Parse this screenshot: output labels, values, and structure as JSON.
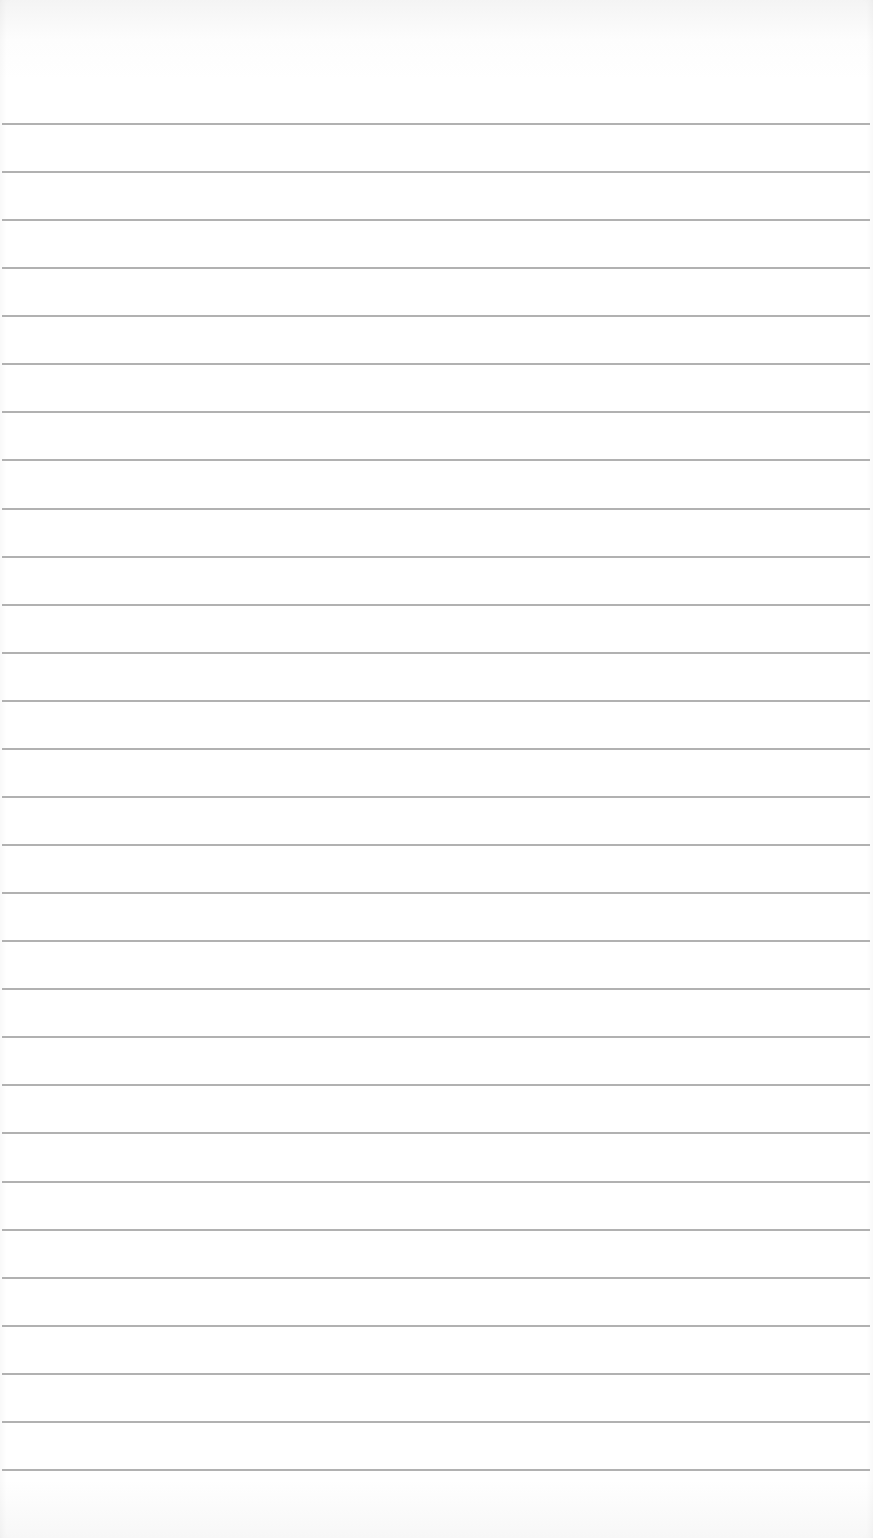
{
  "page": {
    "type": "lined-paper",
    "background_color": "#ffffff",
    "rule_color": "#a9a9a9",
    "first_rule_y": 124,
    "rule_spacing": 48.07,
    "rule_count": 29
  }
}
